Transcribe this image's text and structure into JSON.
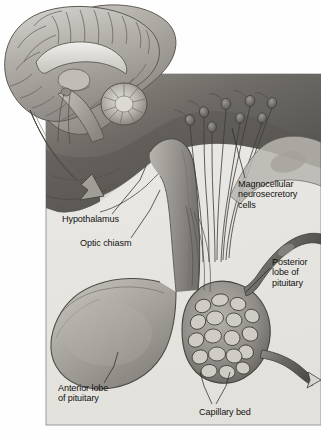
{
  "figure": {
    "kind": "anatomical-illustration",
    "style": "grayscale medical textbook drawing",
    "background_color": "#ffffff",
    "panel_fill": "#e7e6e2",
    "panel_border_color": "#9a9a95",
    "ink_color": "#2b2b2b",
    "label_color": "#121212"
  },
  "panel": {
    "x": 46,
    "y": 74,
    "width": 275,
    "height": 351
  },
  "inset": {
    "name": "sagittal-brain-inset",
    "description": "Midsagittal section of the human brain showing cerebral cortex, corpus callosum, brainstem and cerebellum",
    "parts": [
      "cerebral cortex",
      "corpus callosum",
      "thalamus",
      "brainstem",
      "cerebellum",
      "pituitary"
    ]
  },
  "magnify_arrow": {
    "name": "magnification-arrow",
    "description": "Large curved arrow sweeping from the brain inset down and to the right into the enlarged view"
  },
  "labels": [
    {
      "id": "hypothalamus",
      "text": "Hypothalamus",
      "lines": [
        "Hypothalamus"
      ],
      "x": 62,
      "y": 219
    },
    {
      "id": "optic-chiasm",
      "text": "Optic chiasm",
      "lines": [
        "Optic chiasm"
      ],
      "x": 80,
      "y": 243
    },
    {
      "id": "magnocellular",
      "text": "Magnocellular neurosecretory cells",
      "lines": [
        "Magnocellular",
        "neurosecretory",
        "cells"
      ],
      "x": 238,
      "y": 184
    },
    {
      "id": "posterior-lobe",
      "text": "Posterior lobe of pituitary",
      "lines": [
        "Posterior",
        "lobe of",
        "pituitary"
      ],
      "x": 272,
      "y": 262
    },
    {
      "id": "anterior-lobe",
      "text": "Anterior lobe of pituitary",
      "lines": [
        "Anterior lobe",
        "of pituitary"
      ],
      "x": 58,
      "y": 388
    },
    {
      "id": "capillary-bed",
      "text": "Capillary bed",
      "lines": [
        "Capillary bed"
      ],
      "x": 199,
      "y": 412
    }
  ],
  "structures": [
    {
      "id": "magnocellular-neurons",
      "label": "Magnocellular neurosecretory cells",
      "count_drawn": 8
    },
    {
      "id": "pituitary-stalk",
      "label": "Infundibulum / pituitary stalk"
    },
    {
      "id": "anterior-lobe-body",
      "label": "Anterior lobe of pituitary (adenohypophysis)"
    },
    {
      "id": "posterior-lobe-body",
      "label": "Posterior lobe of pituitary (neurohypophysis)"
    },
    {
      "id": "capillary-network",
      "label": "Capillary bed within posterior lobe"
    },
    {
      "id": "inflow-vessel",
      "label": "Arterial supply entering from upper right"
    },
    {
      "id": "outflow-vessel",
      "label": "Venous drainage exiting to lower right"
    },
    {
      "id": "optic-chiasm-body",
      "label": "Optic chiasm"
    },
    {
      "id": "hypothalamus-body",
      "label": "Hypothalamus"
    }
  ]
}
